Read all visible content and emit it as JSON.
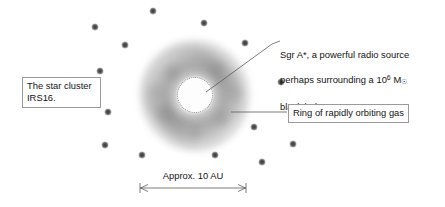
{
  "figure": {
    "background_color": "#ffffff",
    "width": 445,
    "height": 207
  },
  "annotations": {
    "star_cluster": {
      "label": "The star cluster\nIRS16.",
      "boxed": true,
      "x": 22,
      "y": 77,
      "width": 78,
      "height": 31
    },
    "sgr_a_star": {
      "label_line1": "Sgr A*, a powerful radio source",
      "label_line2_pre": "perhaps surrounding a 10",
      "label_line2_exp": "6",
      "label_line2_unit": "M",
      "label_line2_unit_sub": "☉",
      "label_line3": "black hole",
      "boxed": false,
      "x": 280,
      "y": 37
    },
    "gas_ring": {
      "label": "Ring of rapidly orbiting gas",
      "boxed": true,
      "x": 288,
      "y": 104,
      "width": 131,
      "height": 18
    }
  },
  "scale_bar": {
    "label": "Approx. 10 AU",
    "x1": 140,
    "x2": 246,
    "y": 188
  },
  "objects": {
    "gas_ring": {
      "name": "ring-of-gas",
      "center_x": 195,
      "center_y": 95,
      "outer_diameter": 112,
      "color": "#6e6e6e"
    },
    "central_source": {
      "name": "sgr-a-star-core",
      "center_x": 195,
      "center_y": 95,
      "diameter": 34,
      "color": "#fdfdfd",
      "edge_color": "#8e8e8e"
    }
  },
  "stars": {
    "cluster_name": "IRS16",
    "color": "#3b3b3b",
    "positions": [
      {
        "x": 95,
        "y": 27
      },
      {
        "x": 125,
        "y": 45
      },
      {
        "x": 153,
        "y": 11
      },
      {
        "x": 204,
        "y": 23
      },
      {
        "x": 245,
        "y": 43
      },
      {
        "x": 100,
        "y": 71
      },
      {
        "x": 281,
        "y": 82
      },
      {
        "x": 108,
        "y": 112
      },
      {
        "x": 254,
        "y": 127
      },
      {
        "x": 105,
        "y": 145
      },
      {
        "x": 142,
        "y": 155
      },
      {
        "x": 215,
        "y": 155
      },
      {
        "x": 293,
        "y": 144
      },
      {
        "x": 262,
        "y": 162
      }
    ]
  },
  "leader_lines": [
    {
      "name": "sgr-a-star-leader",
      "x1": 206,
      "y1": 92,
      "x2": 272,
      "y2": 44,
      "tick_x2": 280,
      "tick_y2": 41
    },
    {
      "name": "gas-ring-leader",
      "x1": 231,
      "y1": 112,
      "x2": 287,
      "y2": 112
    }
  ],
  "icons": {
    "star": "star-dot-icon",
    "arrow_left": "arrow-left-icon",
    "arrow_right": "arrow-right-icon"
  }
}
